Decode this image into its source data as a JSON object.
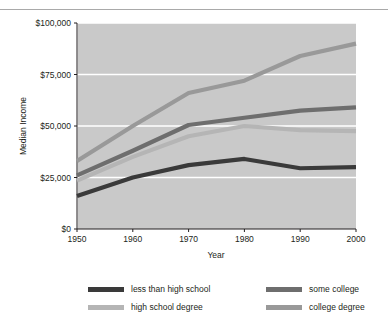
{
  "chart_data": {
    "type": "line",
    "title": "",
    "xlabel": "Year",
    "ylabel": "Median Income",
    "x": [
      1950,
      1960,
      1970,
      1980,
      1990,
      2000
    ],
    "xtick_labels": [
      "1950",
      "1960",
      "1970",
      "1980",
      "1990",
      "2000"
    ],
    "xlim": [
      1950,
      2000
    ],
    "ylim": [
      0,
      100000
    ],
    "ytick_values": [
      0,
      25000,
      50000,
      75000,
      100000
    ],
    "ytick_labels": [
      "$0",
      "$25,000",
      "$50,000",
      "$75,000",
      "$100,000"
    ],
    "grid": "horizontal-and-vertical-white-gridlines",
    "plot_background": "#c9c9c9",
    "legend_position": "below-plot-two-columns",
    "series": [
      {
        "name": "less than high school",
        "color": "#3a3a3a",
        "values": [
          16000,
          25000,
          31000,
          34000,
          29500,
          30000
        ]
      },
      {
        "name": "high school degree",
        "color": "#b5b5b5",
        "values": [
          23500,
          35000,
          45000,
          50000,
          48000,
          47500
        ]
      },
      {
        "name": "some college",
        "color": "#6e6e6e",
        "values": [
          26000,
          38000,
          50500,
          54000,
          57500,
          59000
        ]
      },
      {
        "name": "college degree",
        "color": "#999999",
        "values": [
          33000,
          50000,
          66000,
          72000,
          84000,
          90000
        ]
      }
    ]
  },
  "legend": {
    "entries": [
      {
        "label": "less than high school",
        "color": "#3a3a3a"
      },
      {
        "label": "some college",
        "color": "#6e6e6e"
      },
      {
        "label": "high school degree",
        "color": "#b5b5b5"
      },
      {
        "label": "college degree",
        "color": "#999999"
      }
    ]
  },
  "axes": {
    "y_title": "Median Income",
    "x_title": "Year",
    "y_labels": [
      "$100,000",
      "$75,000",
      "$50,000",
      "$25,000",
      "$0"
    ],
    "x_labels": [
      "1950",
      "1960",
      "1970",
      "1980",
      "1990",
      "2000"
    ]
  }
}
